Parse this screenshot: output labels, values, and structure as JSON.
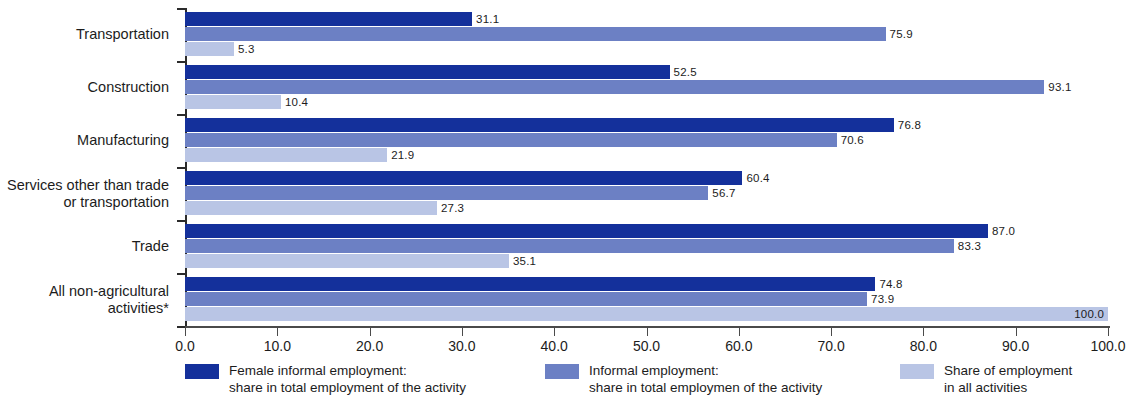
{
  "chart_data": {
    "type": "bar",
    "orientation": "horizontal",
    "title": "",
    "subtitle": "",
    "xlabel": "",
    "ylabel": "",
    "xlim": [
      0,
      100
    ],
    "grid": false,
    "legend_position": "bottom",
    "categories": [
      "Transportation",
      "Construction",
      "Manufacturing",
      "Services other than trade\nor transportation",
      "Trade",
      "All non-agricultural\nactivities*"
    ],
    "series": [
      {
        "name": "Female informal employment:\nshare in total employment of the activity",
        "color": "#14309B",
        "values": [
          31.1,
          52.5,
          76.8,
          60.4,
          87.0,
          74.8
        ],
        "labels": [
          "31.1",
          "52.5",
          "76.8",
          "60.4",
          "87.0",
          "74.8"
        ]
      },
      {
        "name": "Informal employment:\nshare in total employmen of the activity",
        "color": "#6C80C4",
        "values": [
          75.9,
          93.1,
          70.6,
          56.7,
          83.3,
          73.9
        ],
        "labels": [
          "75.9",
          "93.1",
          "70.6",
          "56.7",
          "83.3",
          "73.9"
        ]
      },
      {
        "name": "Share of employment\nin all activities",
        "color": "#B9C5E5",
        "values": [
          5.3,
          10.4,
          21.9,
          27.3,
          35.1,
          100.0
        ],
        "labels": [
          "5.3",
          "10.4",
          "21.9",
          "27.3",
          "35.1",
          "100.0"
        ]
      }
    ],
    "x_ticks": [
      0,
      10,
      20,
      30,
      40,
      50,
      60,
      70,
      80,
      90,
      100
    ],
    "x_tick_labels": [
      "0.0",
      "10.0",
      "20.0",
      "30.0",
      "40.0",
      "50.0",
      "60.0",
      "70.0",
      "80.0",
      "90.0",
      "100.0"
    ]
  },
  "legend": {
    "items": [
      {
        "label": "Female informal employment:\nshare in total employment of the activity",
        "color": "#14309B",
        "swatch_name": "legend-swatch-female-informal"
      },
      {
        "label": "Informal employment:\nshare in total employmen of the activity",
        "color": "#6C80C4",
        "swatch_name": "legend-swatch-informal"
      },
      {
        "label": "Share of employment\nin all activities",
        "color": "#B9C5E5",
        "swatch_name": "legend-swatch-share-all"
      }
    ]
  },
  "colors": {
    "series_1": "#14309B",
    "series_2": "#6C80C4",
    "series_3": "#B9C5E5",
    "axis": "#2b2b2b",
    "text": "#1c1c1c",
    "background": "#ffffff"
  }
}
